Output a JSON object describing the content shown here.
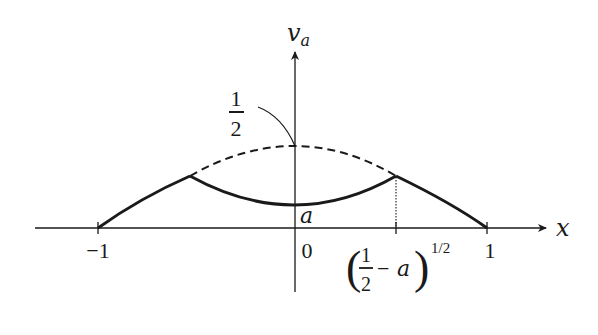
{
  "diagram": {
    "title": "",
    "axes": {
      "x_label": "x",
      "y_label_main": "v",
      "y_label_sub": "a",
      "origin_label": "0"
    },
    "x_ticks": [
      {
        "label": "−1",
        "value": -1
      },
      {
        "label": "1",
        "value": 1
      }
    ],
    "marked_point": {
      "label_open": "(",
      "label_num": "1",
      "label_den": "2",
      "label_minus": "−",
      "label_var": "a",
      "label_close": ")",
      "label_exponent": "1/2",
      "description": "(1/2 − a)^(1/2)"
    },
    "peak_annotation": {
      "num": "1",
      "den": "2",
      "description": "1/2 (peak of dashed curve at x = 0)"
    },
    "min_label": "a",
    "curves": [
      {
        "name": "outer-left",
        "style": "solid",
        "description": "from (−1, 0) up to corner at x = −(1/2 − a)^(1/2)"
      },
      {
        "name": "inner",
        "style": "solid",
        "description": "convex arc between corners, minimum a at x = 0"
      },
      {
        "name": "outer-right",
        "style": "solid",
        "description": "from corner at x = (1/2 − a)^(1/2) down to (1, 0)"
      },
      {
        "name": "dashed-continuation",
        "style": "dashed",
        "description": "continuation of outer curve between corners, peak 1/2 at x = 0"
      },
      {
        "name": "dotted-drop",
        "style": "dotted",
        "description": "vertical from right corner down to x-axis"
      }
    ]
  }
}
